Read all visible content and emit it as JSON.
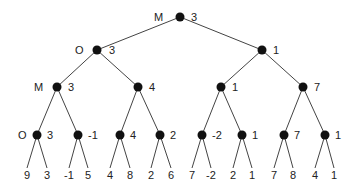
{
  "diagram": {
    "nodes": [
      {
        "id": "n0",
        "x": 180,
        "y": 17,
        "value": "3",
        "player": "M",
        "value_dx": 11,
        "player_dx": -26
      },
      {
        "id": "n1",
        "x": 97,
        "y": 50,
        "value": "3",
        "player": "O",
        "value_dx": 12,
        "player_dx": -22
      },
      {
        "id": "n2",
        "x": 262,
        "y": 50,
        "value": "1",
        "player": "",
        "value_dx": 11,
        "player_dx": 0
      },
      {
        "id": "n3",
        "x": 57,
        "y": 87,
        "value": "3",
        "player": "M",
        "value_dx": 11,
        "player_dx": -23
      },
      {
        "id": "n4",
        "x": 138,
        "y": 87,
        "value": "4",
        "player": "",
        "value_dx": 11,
        "player_dx": 0
      },
      {
        "id": "n5",
        "x": 221,
        "y": 87,
        "value": "1",
        "player": "",
        "value_dx": 11,
        "player_dx": 0
      },
      {
        "id": "n6",
        "x": 303,
        "y": 87,
        "value": "7",
        "player": "",
        "value_dx": 11,
        "player_dx": 0
      },
      {
        "id": "n7",
        "x": 37,
        "y": 135,
        "value": "3",
        "player": "O",
        "value_dx": 10,
        "player_dx": -19
      },
      {
        "id": "n8",
        "x": 78,
        "y": 135,
        "value": "-1",
        "player": "",
        "value_dx": 10,
        "player_dx": 0
      },
      {
        "id": "n9",
        "x": 120,
        "y": 135,
        "value": "4",
        "player": "",
        "value_dx": 10,
        "player_dx": 0
      },
      {
        "id": "n10",
        "x": 160,
        "y": 135,
        "value": "2",
        "player": "",
        "value_dx": 10,
        "player_dx": 0
      },
      {
        "id": "n11",
        "x": 202,
        "y": 135,
        "value": "-2",
        "player": "",
        "value_dx": 10,
        "player_dx": 0
      },
      {
        "id": "n12",
        "x": 242,
        "y": 135,
        "value": "1",
        "player": "",
        "value_dx": 10,
        "player_dx": 0
      },
      {
        "id": "n13",
        "x": 284,
        "y": 135,
        "value": "7",
        "player": "",
        "value_dx": 10,
        "player_dx": 0
      },
      {
        "id": "n14",
        "x": 325,
        "y": 135,
        "value": "1",
        "player": "",
        "value_dx": 10,
        "player_dx": 0
      }
    ],
    "edges": [
      [
        "n0",
        "n1"
      ],
      [
        "n0",
        "n2"
      ],
      [
        "n1",
        "n3"
      ],
      [
        "n1",
        "n4"
      ],
      [
        "n2",
        "n5"
      ],
      [
        "n2",
        "n6"
      ],
      [
        "n3",
        "n7"
      ],
      [
        "n3",
        "n8"
      ],
      [
        "n4",
        "n9"
      ],
      [
        "n4",
        "n10"
      ],
      [
        "n5",
        "n11"
      ],
      [
        "n5",
        "n12"
      ],
      [
        "n6",
        "n13"
      ],
      [
        "n6",
        "n14"
      ]
    ],
    "leaves": [
      {
        "parent": "n7",
        "x": 27,
        "value": "9"
      },
      {
        "parent": "n7",
        "x": 47,
        "value": "3"
      },
      {
        "parent": "n8",
        "x": 69,
        "value": "-1"
      },
      {
        "parent": "n8",
        "x": 88,
        "value": "5"
      },
      {
        "parent": "n9",
        "x": 110,
        "value": "4"
      },
      {
        "parent": "n9",
        "x": 130,
        "value": "8"
      },
      {
        "parent": "n10",
        "x": 151,
        "value": "2"
      },
      {
        "parent": "n10",
        "x": 171,
        "value": "6"
      },
      {
        "parent": "n11",
        "x": 192,
        "value": "7"
      },
      {
        "parent": "n11",
        "x": 211,
        "value": "-2"
      },
      {
        "parent": "n12",
        "x": 233,
        "value": "2"
      },
      {
        "parent": "n12",
        "x": 252,
        "value": "1"
      },
      {
        "parent": "n13",
        "x": 274,
        "value": "7"
      },
      {
        "parent": "n13",
        "x": 293,
        "value": "8"
      },
      {
        "parent": "n14",
        "x": 315,
        "value": "4"
      },
      {
        "parent": "n14",
        "x": 334,
        "value": "1"
      }
    ],
    "leaf_line_end_y": 168,
    "leaf_text_y": 179,
    "node_radius": 4.5,
    "colors": {
      "node": "#111111",
      "edge": "#444444",
      "text": "#222222"
    }
  }
}
